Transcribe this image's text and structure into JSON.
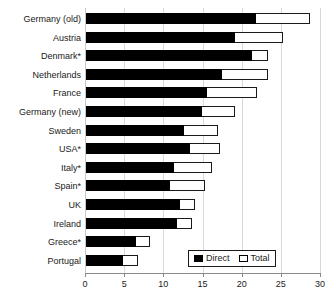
{
  "chart_data": {
    "type": "bar",
    "orientation": "horizontal",
    "title": "",
    "subtitle": "",
    "xlabel": "",
    "ylabel": "",
    "xlim": [
      0,
      30
    ],
    "xticks": [
      0,
      5,
      10,
      15,
      20,
      25,
      30
    ],
    "xtick_labels": [
      "0",
      "5",
      "10",
      "15",
      "20",
      "25",
      "30"
    ],
    "grid": true,
    "grid_axis": "x",
    "legend_position": "bottom-right",
    "categories": [
      "Germany (old)",
      "Austria",
      "Denmark*",
      "Netherlands",
      "France",
      "Germany (new)",
      "Sweden",
      "USA*",
      "Italy*",
      "Spain*",
      "UK",
      "Ireland",
      "Greece*",
      "Portugal"
    ],
    "series": [
      {
        "name": "Direct",
        "color": "#000000",
        "style": "filled",
        "values": [
          21.8,
          19.1,
          21.3,
          17.5,
          15.6,
          14.9,
          12.7,
          13.4,
          11.3,
          10.8,
          12.1,
          11.8,
          6.5,
          4.9
        ]
      },
      {
        "name": "Total",
        "color": "#ffffff",
        "style": "hollow-outline",
        "values": [
          28.7,
          25.3,
          23.4,
          23.4,
          22.0,
          19.1,
          17.0,
          17.2,
          16.2,
          15.3,
          14.0,
          13.6,
          8.3,
          6.8
        ]
      }
    ]
  },
  "legend": {
    "entries": [
      {
        "label": "Direct",
        "swatch": "filled"
      },
      {
        "label": "Total",
        "swatch": "hollow"
      }
    ]
  },
  "colors": {
    "direct": "#000000",
    "total": "#ffffff",
    "outline": "#1a1a1a",
    "grid": "#d9d9d9",
    "axis": "#8a8a8a",
    "background": "#ffffff"
  }
}
